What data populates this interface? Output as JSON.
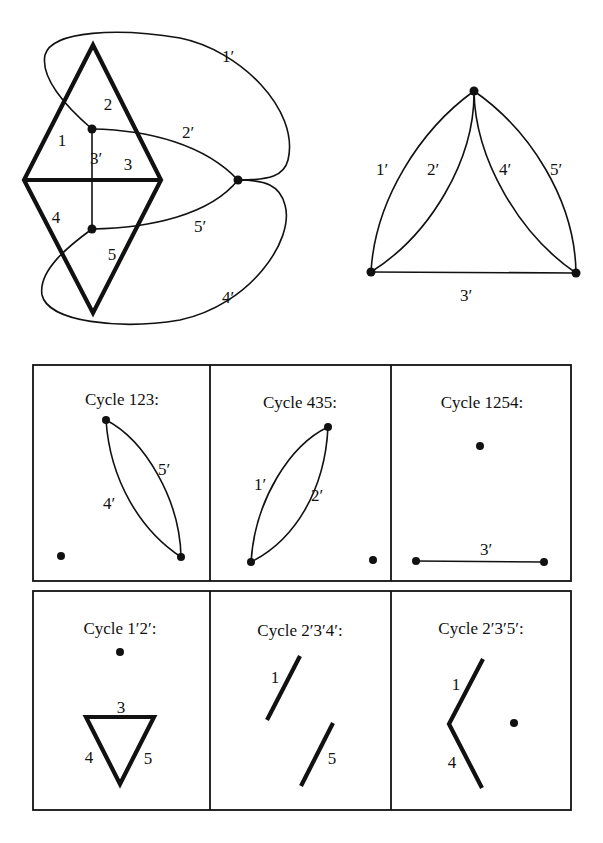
{
  "figure": {
    "primal_graph": {
      "face_labels": [
        {
          "text": "1",
          "x": 62,
          "y": 146
        },
        {
          "text": "2",
          "x": 108,
          "y": 110
        },
        {
          "text": "3",
          "x": 128,
          "y": 170
        },
        {
          "text": "4",
          "x": 56,
          "y": 223
        },
        {
          "text": "5",
          "x": 112,
          "y": 260
        }
      ],
      "dual_edge_labels": [
        {
          "text": "1′",
          "x": 228,
          "y": 62
        },
        {
          "text": "2′",
          "x": 188,
          "y": 138
        },
        {
          "text": "3′",
          "x": 96,
          "y": 164
        },
        {
          "text": "5′",
          "x": 200,
          "y": 232
        },
        {
          "text": "4′",
          "x": 228,
          "y": 303
        }
      ]
    },
    "dual_graph": {
      "edge_labels": [
        {
          "text": "1′",
          "x": 382,
          "y": 175
        },
        {
          "text": "2′",
          "x": 433,
          "y": 175
        },
        {
          "text": "4′",
          "x": 505,
          "y": 175
        },
        {
          "text": "5′",
          "x": 556,
          "y": 175
        },
        {
          "text": "3′",
          "x": 466,
          "y": 301
        }
      ]
    },
    "cycles": [
      {
        "title": "Cycle  123:",
        "tx": 122,
        "ty": 405,
        "labels": [
          {
            "text": "5′",
            "x": 164,
            "y": 475
          },
          {
            "text": "4′",
            "x": 109,
            "y": 509
          }
        ]
      },
      {
        "title": "Cycle  435:",
        "tx": 300,
        "ty": 408,
        "labels": [
          {
            "text": "1′",
            "x": 260,
            "y": 490
          },
          {
            "text": "2′",
            "x": 317,
            "y": 501
          }
        ]
      },
      {
        "title": "Cycle  1254:",
        "tx": 482,
        "ty": 408,
        "labels": [
          {
            "text": "3′",
            "x": 486,
            "y": 555
          }
        ]
      },
      {
        "title": "Cycle  1′2′:",
        "tx": 120,
        "ty": 634,
        "labels": [
          {
            "text": "3",
            "x": 121,
            "y": 713
          },
          {
            "text": "4",
            "x": 89,
            "y": 763
          },
          {
            "text": "5",
            "x": 148,
            "y": 764
          }
        ]
      },
      {
        "title": "Cycle  2′3′4′:",
        "tx": 300,
        "ty": 636,
        "labels": [
          {
            "text": "1",
            "x": 275,
            "y": 683
          },
          {
            "text": "5",
            "x": 332,
            "y": 764
          }
        ]
      },
      {
        "title": "Cycle  2′3′5′:",
        "tx": 481,
        "ty": 634,
        "labels": [
          {
            "text": "1",
            "x": 456,
            "y": 690
          },
          {
            "text": "4",
            "x": 452,
            "y": 768
          }
        ]
      }
    ]
  }
}
